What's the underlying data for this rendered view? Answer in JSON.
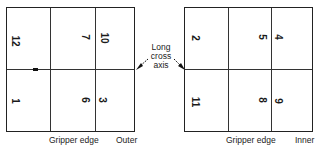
{
  "diagram": {
    "center_label": [
      "Long",
      "cross",
      "axis"
    ],
    "left_sheet": {
      "edge_label": "Gripper edge",
      "side_label": "Outer",
      "pages": [
        {
          "label": "12",
          "row": "top",
          "col": "left"
        },
        {
          "label": "7",
          "row": "top",
          "col": "middle"
        },
        {
          "label": "10",
          "row": "top",
          "col": "right"
        },
        {
          "label": "1",
          "row": "bottom",
          "col": "left"
        },
        {
          "label": "6",
          "row": "bottom",
          "col": "middle"
        },
        {
          "label": "3",
          "row": "bottom",
          "col": "right"
        }
      ]
    },
    "right_sheet": {
      "edge_label": "Gripper edge",
      "side_label": "Inner",
      "pages": [
        {
          "label": "2",
          "row": "top",
          "col": "left"
        },
        {
          "label": "5",
          "row": "top",
          "col": "middle"
        },
        {
          "label": "4",
          "row": "top",
          "col": "right"
        },
        {
          "label": "11",
          "row": "bottom",
          "col": "left"
        },
        {
          "label": "8",
          "row": "bottom",
          "col": "middle"
        },
        {
          "label": "9",
          "row": "bottom",
          "col": "right"
        }
      ]
    }
  }
}
